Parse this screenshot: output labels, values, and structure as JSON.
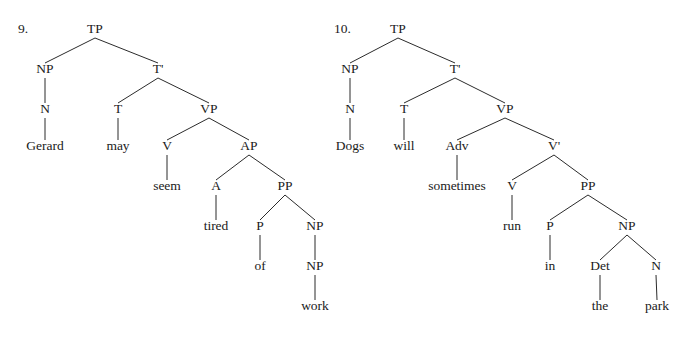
{
  "figure": {
    "background_color": "#ffffff",
    "ink_color": "#1a1a1a",
    "line_color": "#2b2b2b",
    "width": 689,
    "height": 340
  },
  "trees": [
    {
      "id": "tree-9",
      "number_label": "9.",
      "number_x": 18,
      "number_y": 33,
      "sentence": "Gerard may seem tired of work",
      "nodes": [
        {
          "key": "tp",
          "label": "TP",
          "x": 95,
          "y": 33,
          "kind": "category"
        },
        {
          "key": "np",
          "label": "NP",
          "x": 45,
          "y": 73,
          "kind": "category"
        },
        {
          "key": "tbar",
          "label": "T'",
          "x": 158,
          "y": 73,
          "kind": "category"
        },
        {
          "key": "n",
          "label": "N",
          "x": 45,
          "y": 113,
          "kind": "category"
        },
        {
          "key": "t",
          "label": "T",
          "x": 118,
          "y": 113,
          "kind": "category"
        },
        {
          "key": "vp",
          "label": "VP",
          "x": 209,
          "y": 113,
          "kind": "category"
        },
        {
          "key": "gerard",
          "label": "Gerard",
          "x": 45,
          "y": 150,
          "kind": "word"
        },
        {
          "key": "may",
          "label": "may",
          "x": 118,
          "y": 150,
          "kind": "word"
        },
        {
          "key": "v",
          "label": "V",
          "x": 167,
          "y": 150,
          "kind": "category"
        },
        {
          "key": "ap",
          "label": "AP",
          "x": 249,
          "y": 150,
          "kind": "category"
        },
        {
          "key": "seem",
          "label": "seem",
          "x": 167,
          "y": 190,
          "kind": "word"
        },
        {
          "key": "a",
          "label": "A",
          "x": 216,
          "y": 190,
          "kind": "category"
        },
        {
          "key": "pp",
          "label": "PP",
          "x": 285,
          "y": 190,
          "kind": "category"
        },
        {
          "key": "tired",
          "label": "tired",
          "x": 216,
          "y": 230,
          "kind": "word"
        },
        {
          "key": "p",
          "label": "P",
          "x": 260,
          "y": 230,
          "kind": "category"
        },
        {
          "key": "np2",
          "label": "NP",
          "x": 315,
          "y": 230,
          "kind": "category"
        },
        {
          "key": "of",
          "label": "of",
          "x": 260,
          "y": 270,
          "kind": "word"
        },
        {
          "key": "np3",
          "label": "NP",
          "x": 315,
          "y": 270,
          "kind": "category"
        },
        {
          "key": "work",
          "label": "work",
          "x": 315,
          "y": 310,
          "kind": "word"
        }
      ],
      "edges": [
        {
          "from": "tp",
          "to": "np"
        },
        {
          "from": "tp",
          "to": "tbar"
        },
        {
          "from": "np",
          "to": "n"
        },
        {
          "from": "n",
          "to": "gerard"
        },
        {
          "from": "tbar",
          "to": "t"
        },
        {
          "from": "tbar",
          "to": "vp"
        },
        {
          "from": "t",
          "to": "may"
        },
        {
          "from": "vp",
          "to": "v"
        },
        {
          "from": "vp",
          "to": "ap"
        },
        {
          "from": "v",
          "to": "seem"
        },
        {
          "from": "ap",
          "to": "a"
        },
        {
          "from": "ap",
          "to": "pp"
        },
        {
          "from": "a",
          "to": "tired"
        },
        {
          "from": "pp",
          "to": "p"
        },
        {
          "from": "pp",
          "to": "np2"
        },
        {
          "from": "p",
          "to": "of"
        },
        {
          "from": "np2",
          "to": "np3"
        },
        {
          "from": "np3",
          "to": "work"
        }
      ]
    },
    {
      "id": "tree-10",
      "number_label": "10.",
      "number_x": 334,
      "number_y": 33,
      "sentence": "Dogs will sometimes run in the park",
      "nodes": [
        {
          "key": "tp",
          "label": "TP",
          "x": 398,
          "y": 33,
          "kind": "category"
        },
        {
          "key": "np",
          "label": "NP",
          "x": 350,
          "y": 73,
          "kind": "category"
        },
        {
          "key": "tbar",
          "label": "T'",
          "x": 455,
          "y": 73,
          "kind": "category"
        },
        {
          "key": "n",
          "label": "N",
          "x": 350,
          "y": 113,
          "kind": "category"
        },
        {
          "key": "t",
          "label": "T",
          "x": 404,
          "y": 113,
          "kind": "category"
        },
        {
          "key": "vp",
          "label": "VP",
          "x": 505,
          "y": 113,
          "kind": "category"
        },
        {
          "key": "dogs",
          "label": "Dogs",
          "x": 350,
          "y": 150,
          "kind": "word"
        },
        {
          "key": "will",
          "label": "will",
          "x": 404,
          "y": 150,
          "kind": "word"
        },
        {
          "key": "adv",
          "label": "Adv",
          "x": 457,
          "y": 150,
          "kind": "category"
        },
        {
          "key": "vbar",
          "label": "V'",
          "x": 554,
          "y": 150,
          "kind": "category"
        },
        {
          "key": "sometimes",
          "label": "sometimes",
          "x": 457,
          "y": 190,
          "kind": "word"
        },
        {
          "key": "v",
          "label": "V",
          "x": 512,
          "y": 190,
          "kind": "category"
        },
        {
          "key": "pp",
          "label": "PP",
          "x": 588,
          "y": 190,
          "kind": "category"
        },
        {
          "key": "run",
          "label": "run",
          "x": 512,
          "y": 230,
          "kind": "word"
        },
        {
          "key": "p",
          "label": "P",
          "x": 550,
          "y": 230,
          "kind": "category"
        },
        {
          "key": "np2",
          "label": "NP",
          "x": 627,
          "y": 230,
          "kind": "category"
        },
        {
          "key": "in",
          "label": "in",
          "x": 550,
          "y": 270,
          "kind": "word"
        },
        {
          "key": "det",
          "label": "Det",
          "x": 600,
          "y": 270,
          "kind": "category"
        },
        {
          "key": "n2",
          "label": "N",
          "x": 656,
          "y": 270,
          "kind": "category"
        },
        {
          "key": "the",
          "label": "the",
          "x": 600,
          "y": 310,
          "kind": "word"
        },
        {
          "key": "park",
          "label": "park",
          "x": 657,
          "y": 310,
          "kind": "word"
        }
      ],
      "edges": [
        {
          "from": "tp",
          "to": "np"
        },
        {
          "from": "tp",
          "to": "tbar"
        },
        {
          "from": "np",
          "to": "n"
        },
        {
          "from": "n",
          "to": "dogs"
        },
        {
          "from": "tbar",
          "to": "t"
        },
        {
          "from": "tbar",
          "to": "vp"
        },
        {
          "from": "t",
          "to": "will"
        },
        {
          "from": "vp",
          "to": "adv"
        },
        {
          "from": "vp",
          "to": "vbar"
        },
        {
          "from": "adv",
          "to": "sometimes"
        },
        {
          "from": "vbar",
          "to": "v"
        },
        {
          "from": "vbar",
          "to": "pp"
        },
        {
          "from": "v",
          "to": "run"
        },
        {
          "from": "pp",
          "to": "p"
        },
        {
          "from": "pp",
          "to": "np2"
        },
        {
          "from": "p",
          "to": "in"
        },
        {
          "from": "np2",
          "to": "det"
        },
        {
          "from": "np2",
          "to": "n2"
        },
        {
          "from": "det",
          "to": "the"
        },
        {
          "from": "n2",
          "to": "park"
        }
      ]
    }
  ]
}
